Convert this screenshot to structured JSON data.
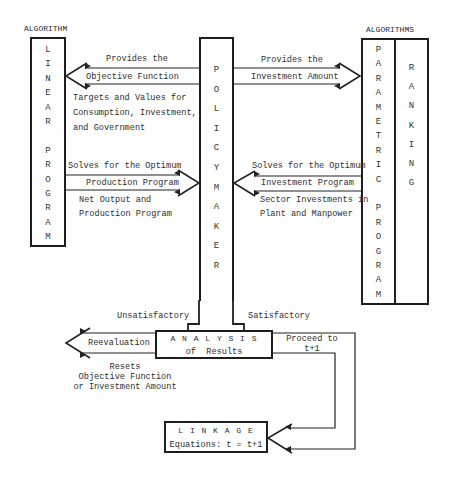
{
  "headings": {
    "left": "ALGORITHM",
    "right": "ALGORITHMS"
  },
  "boxes": {
    "linear_program": [
      "L",
      "I",
      "N",
      "E",
      "A",
      "R",
      "",
      "P",
      "R",
      "O",
      "G",
      "R",
      "A",
      "M"
    ],
    "policy_maker": [
      "P",
      "O",
      "L",
      "I",
      "C",
      "Y",
      "M",
      "A",
      "K",
      "E",
      "R"
    ],
    "parametric_program": [
      "P",
      "A",
      "R",
      "A",
      "M",
      "E",
      "T",
      "R",
      "I",
      "C",
      "",
      "P",
      "R",
      "O",
      "G",
      "R",
      "A",
      "M"
    ],
    "ranking": [
      "R",
      "A",
      "N",
      "K",
      "I",
      "N",
      "G"
    ],
    "analysis": {
      "title": "A N A L Y S I S",
      "subtitle": "of  Results"
    },
    "linkage": {
      "title": "L I N K A G E",
      "subtitle": "Equations: t = t+1"
    }
  },
  "arrows": {
    "objective": {
      "above": "Provides the",
      "inside": "Objective Function",
      "below": [
        "Targets and Values for",
        "Consumption, Investment,",
        "and Government"
      ]
    },
    "investment_amount": {
      "above": "Provides the",
      "inside": "Investment Amount"
    },
    "production": {
      "above": "Solves for the Optimum",
      "inside": "Production Program",
      "below": [
        "Net Output and",
        "Production Program"
      ]
    },
    "investment_program": {
      "above": "Solves for the Optimum",
      "inside": "Investment Program",
      "below": [
        "Sector Investments in",
        "Plant and Manpower"
      ]
    },
    "unsatisfactory": "Unsatisfactory",
    "satisfactory": "Satisfactory",
    "reevaluation": {
      "inside": "Reevaluation",
      "below": [
        "Resets",
        "Objective Function",
        "or Investment Amount"
      ]
    },
    "proceed": [
      "Proceed to",
      "t+1"
    ]
  }
}
